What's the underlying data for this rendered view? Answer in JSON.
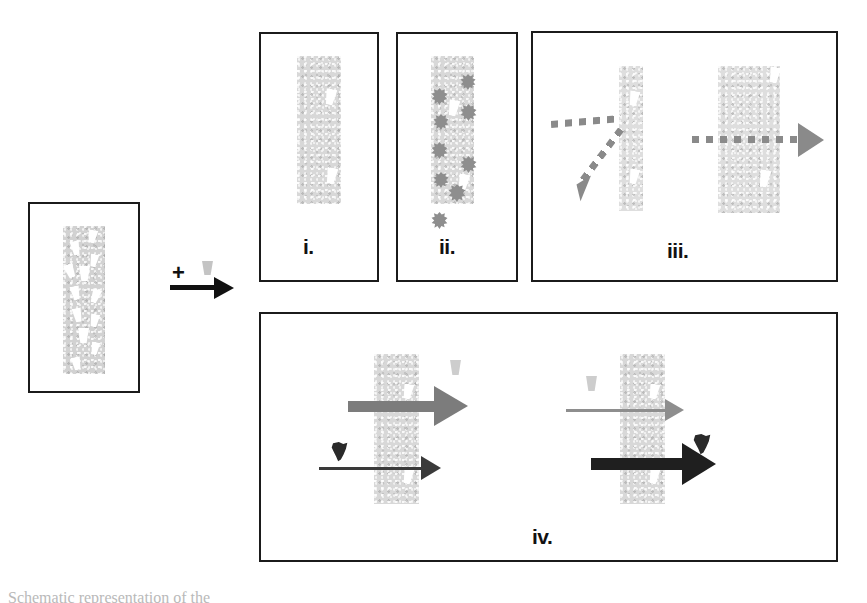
{
  "figure": {
    "type": "scientific-schematic",
    "background_color": "#ffffff",
    "outline_color": "#1b1b1b",
    "membrane_color": "#d2d2d2",
    "pore_color": "#ffffff",
    "blob_color": "#8e8e8e",
    "dark_particle_color": "#2a2a2a",
    "dotted_arrow_color": "#8a8a8a"
  },
  "reaction": {
    "plus_symbol": "+",
    "plus_icon_name": "plus-sign",
    "reagent_icon_name": "cup-particle-icon",
    "arrow_icon_name": "reaction-arrow-right",
    "arrow_color": "#111111"
  },
  "source_panel": {
    "name": "source-membrane-panel",
    "pore_count": 12,
    "strip_label": "porous membrane strip"
  },
  "panels": [
    {
      "id": "i",
      "label": "i.",
      "name": "panel-i",
      "outcome": "no binding, pores remain open",
      "pore_count": 2,
      "blob_count": 0
    },
    {
      "id": "ii",
      "label": "ii.",
      "name": "panel-ii",
      "outcome": "surface fouling, blobs deposited on membrane",
      "pore_count": 2,
      "blob_count": 9
    },
    {
      "id": "iii",
      "label": "iii.",
      "name": "panel-iii",
      "outcome": "rejection versus transmission, dotted flux arrows",
      "sub_scenarios": [
        {
          "name": "reflected-flux",
          "arrow": "dotted-reflect"
        },
        {
          "name": "transmitted-flux",
          "arrow": "dotted-through"
        }
      ]
    },
    {
      "id": "iv",
      "label": "iv.",
      "name": "panel-iv",
      "outcome": "concentration-dependent flux, thick versus thin arrows",
      "sub_scenarios": [
        {
          "name": "high-flux-low-retention",
          "top_arrow": "thick-gray-arrow",
          "bottom_arrow": "thin-dark-arrow",
          "top_particle": "pale-cup",
          "bottom_particle": "dark-cup"
        },
        {
          "name": "low-flux-high-retention",
          "top_arrow": "thin-gray-arrow",
          "bottom_arrow": "thick-dark-arrow",
          "top_particle": "pale-cup",
          "bottom_particle": "dark-cup"
        }
      ]
    }
  ],
  "caption": {
    "cut_off_text": "Schematic representation of the"
  }
}
